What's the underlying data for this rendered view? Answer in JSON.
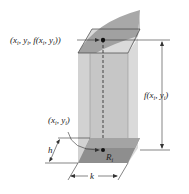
{
  "figure": {
    "type": "3d-prism-volume-element",
    "labels": {
      "top_point": "(xᵢ, yᵢ, f(xᵢ, yᵢ))",
      "top_point_parts": {
        "open": "(",
        "x": "x",
        "i1": "i",
        "sep1": ", ",
        "y": "y",
        "i2": "i",
        "sep2": ", ",
        "f": "f(",
        "x2": "x",
        "i3": "i",
        "sep3": ", ",
        "y2": "y",
        "i4": "i",
        "close": "))"
      },
      "height": "f(xᵢ, yᵢ)",
      "height_parts": {
        "f": "f(",
        "x": "x",
        "i1": "i",
        "sep": ", ",
        "y": "y",
        "i2": "i",
        "close": ")"
      },
      "base_point": "(xᵢ, yᵢ)",
      "base_point_parts": {
        "open": "(",
        "x": "x",
        "i1": "i",
        "sep": ", ",
        "y": "y",
        "i2": "i",
        "close": ")"
      },
      "region": "Rᵢ",
      "region_parts": {
        "R": "R",
        "i": "i"
      },
      "depth": "h",
      "width": "k"
    },
    "colors": {
      "prism_front": "#c4c4c4",
      "prism_side": "#d8d8d8",
      "surface": "#9a9a9a",
      "surface_light": "#bcbcbc",
      "base_region": "#8a8a8a",
      "lines": "#333333"
    }
  }
}
